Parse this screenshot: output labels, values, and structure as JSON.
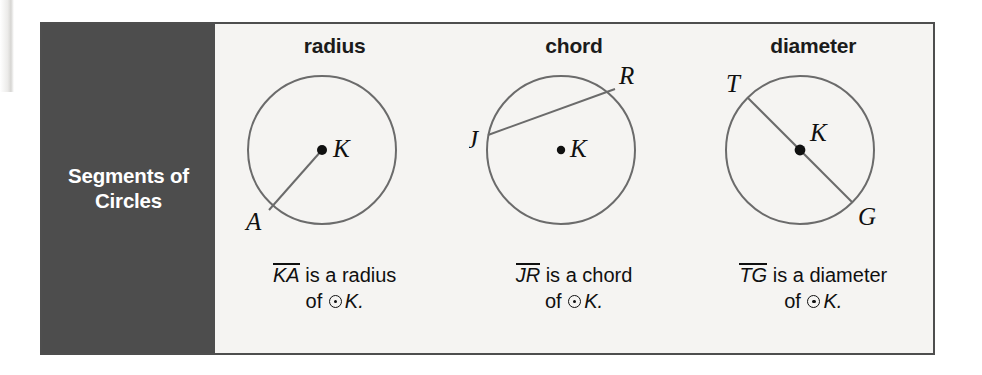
{
  "figure": {
    "side_label": "Segments of\nCircles",
    "circle_symbol": "⊙",
    "colors": {
      "panel_bg": "#4d4d4d",
      "panel_text": "#ffffff",
      "frame_border": "#4e4e4e",
      "page_bg": "#f3f2f0",
      "stroke": "#6b6b6b",
      "ink": "#101010"
    },
    "columns": [
      {
        "header": "radius",
        "center_label": "K",
        "point_labels": [
          "A"
        ],
        "caption_segment": "KA",
        "caption_line1_rest": " is a radius",
        "caption_line2_prefix": "of ",
        "caption_line2_suffix": "K.",
        "diagram": {
          "type": "circle-with-radius",
          "center": [
            92,
            88
          ],
          "radius": 74,
          "segment_from": "center",
          "segment_to_point": [
            39,
            148
          ],
          "center_dot": true
        }
      },
      {
        "header": "chord",
        "center_label": "K",
        "point_labels": [
          "J",
          "R"
        ],
        "caption_segment": "JR",
        "caption_line1_rest": " is a chord",
        "caption_line2_prefix": "of ",
        "caption_line2_suffix": "K.",
        "diagram": {
          "type": "circle-with-chord",
          "center": [
            92,
            88
          ],
          "radius": 74,
          "chord_from_point": [
            19,
            73
          ],
          "chord_to_point": [
            146,
            27
          ],
          "center_dot": true
        }
      },
      {
        "header": "diameter",
        "center_label": "K",
        "point_labels": [
          "T",
          "G"
        ],
        "caption_segment": "TG",
        "caption_line1_rest": " is a diameter",
        "caption_line2_prefix": "of ",
        "caption_line2_suffix": "K.",
        "diagram": {
          "type": "circle-with-diameter",
          "center": [
            92,
            88
          ],
          "radius": 74,
          "diameter_from_point": [
            40,
            36
          ],
          "diameter_to_point": [
            144,
            140
          ],
          "center_dot": true
        }
      }
    ]
  }
}
